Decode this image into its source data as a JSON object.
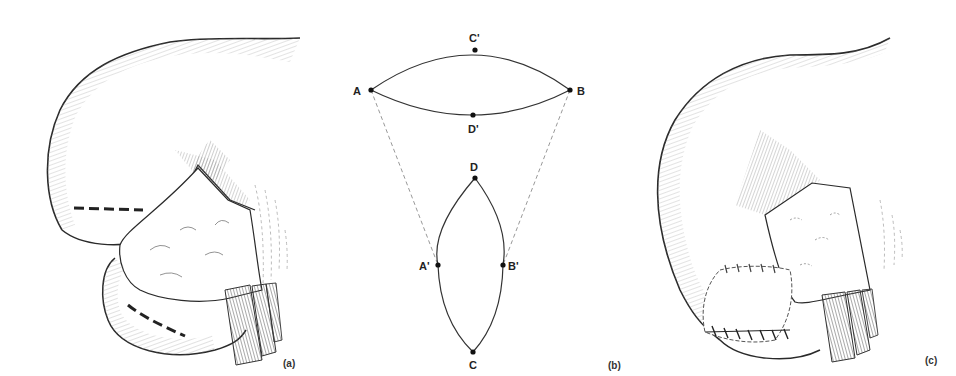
{
  "figure": {
    "panels": [
      {
        "id": "a",
        "label": "(a)",
        "description": "Organ illustration with two dashed incision lines"
      },
      {
        "id": "b",
        "label": "(b)",
        "description": "Geometric diagram of flap transposition"
      },
      {
        "id": "c",
        "label": "(c)",
        "description": "Organ illustration after sutured closure"
      }
    ],
    "diagram_points": {
      "A": "A",
      "B": "B",
      "C_prime": "C'",
      "D_prime": "D'",
      "D": "D",
      "C": "C",
      "A_prime": "A'",
      "B_prime": "B'"
    },
    "colors": {
      "line": "#2a2a2a",
      "hatch": "#8a8a8a",
      "dash": "#999999",
      "background": "#ffffff"
    }
  }
}
